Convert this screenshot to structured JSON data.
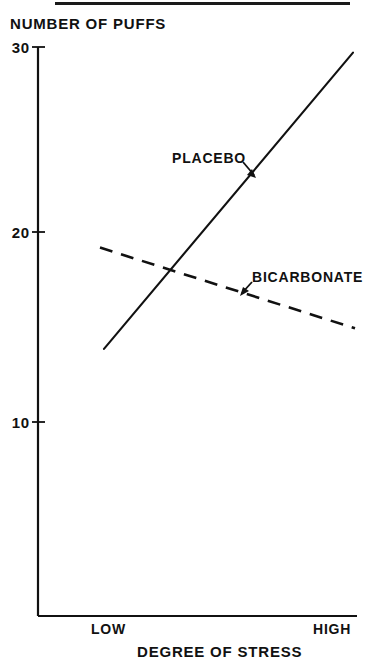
{
  "figure": {
    "top_rule_present": true,
    "background_color": "#ffffff",
    "ink_color": "#111111"
  },
  "chart_data": {
    "type": "line",
    "title": "",
    "ylabel": "NUMBER OF PUFFS",
    "xlabel": "DEGREE OF STRESS",
    "x": [
      "LOW",
      "HIGH"
    ],
    "xtick_labels": [
      "LOW",
      "HIGH"
    ],
    "ytick_labels": [
      "30",
      "20",
      "10"
    ],
    "yticks": [
      30,
      20,
      10
    ],
    "ylim": [
      7.5,
      30
    ],
    "xlim": [
      0,
      1
    ],
    "grid": false,
    "legend_position": "inline-annotations",
    "series": [
      {
        "name": "PLACEBO",
        "style": "solid",
        "values": [
          13.9,
          29.7
        ],
        "annotation": {
          "text": "PLACEBO",
          "arrow": true,
          "arrow_direction": "down-right"
        }
      },
      {
        "name": "BICARBONATE",
        "style": "dashed",
        "values": [
          19.3,
          15.0
        ],
        "annotation": {
          "text": "BICARBONATE",
          "arrow": true,
          "arrow_direction": "down-left"
        }
      }
    ],
    "annotations": [
      {
        "text": "PLACEBO"
      },
      {
        "text": "BICARBONATE"
      }
    ]
  },
  "axis": {
    "y_title": "NUMBER OF PUFFS",
    "x_title": "DEGREE OF STRESS",
    "y_ticks": [
      {
        "label": "30"
      },
      {
        "label": "20"
      },
      {
        "label": "10"
      }
    ],
    "x_ticks": [
      {
        "label": "LOW"
      },
      {
        "label": "HIGH"
      }
    ]
  },
  "series_labels": {
    "placebo": "PLACEBO",
    "bicarbonate": "BICARBONATE"
  }
}
